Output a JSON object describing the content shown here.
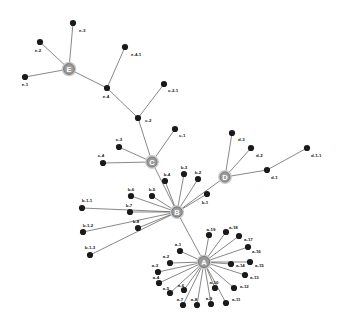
{
  "diagram": {
    "type": "network-graph",
    "title": "",
    "background_color": "#ffffff",
    "leaf_node_color": "#1a1a1a",
    "hub_node_color": "#9a9a9a",
    "hub_halo_color": "#c9c9c9",
    "edge_color": "#555555",
    "label_color": "#111111",
    "hubs": [
      {
        "id": "A",
        "label": "A",
        "x": 204,
        "y": 262,
        "r": 5.6
      },
      {
        "id": "B",
        "label": "B",
        "x": 177,
        "y": 212,
        "r": 5.2
      },
      {
        "id": "C",
        "label": "C",
        "x": 152,
        "y": 162,
        "r": 5.0
      },
      {
        "id": "D",
        "label": "D",
        "x": 225,
        "y": 177,
        "r": 5.0
      },
      {
        "id": "E",
        "label": "E",
        "x": 69,
        "y": 69,
        "r": 5.4
      }
    ],
    "nodes": [
      {
        "id": "e-1",
        "label": "e-1",
        "x": 25,
        "y": 77,
        "lx": 25,
        "ly": 84,
        "anchor": "middle"
      },
      {
        "id": "e-2",
        "label": "e-2",
        "x": 40,
        "y": 42,
        "lx": 38,
        "ly": 50,
        "anchor": "middle"
      },
      {
        "id": "e-3",
        "label": "e-3",
        "x": 73,
        "y": 23,
        "lx": 79,
        "ly": 30,
        "anchor": "start"
      },
      {
        "id": "e-4",
        "label": "e-4",
        "x": 107,
        "y": 88,
        "lx": 106,
        "ly": 96,
        "anchor": "middle"
      },
      {
        "id": "e-4-1",
        "label": "e-4-1",
        "x": 125,
        "y": 47,
        "lx": 131,
        "ly": 54,
        "anchor": "start"
      },
      {
        "id": "c-2",
        "label": "c-2",
        "x": 138,
        "y": 118,
        "lx": 145,
        "ly": 120,
        "anchor": "start"
      },
      {
        "id": "c-2-1",
        "label": "c-2-1",
        "x": 164,
        "y": 84,
        "lx": 168,
        "ly": 90,
        "anchor": "start"
      },
      {
        "id": "c-1",
        "label": "c-1",
        "x": 175,
        "y": 129,
        "lx": 179,
        "ly": 135,
        "anchor": "start"
      },
      {
        "id": "c-3",
        "label": "c-3",
        "x": 119,
        "y": 147,
        "lx": 119,
        "ly": 139,
        "anchor": "middle"
      },
      {
        "id": "c-4",
        "label": "c-4",
        "x": 103,
        "y": 163,
        "lx": 101,
        "ly": 155,
        "anchor": "middle"
      },
      {
        "id": "b-1",
        "label": "b-1",
        "x": 207,
        "y": 194,
        "lx": 205,
        "ly": 202,
        "anchor": "middle"
      },
      {
        "id": "b-2",
        "label": "b-2",
        "x": 198,
        "y": 179,
        "lx": 198,
        "ly": 172,
        "anchor": "middle"
      },
      {
        "id": "b-3",
        "label": "b-3",
        "x": 184,
        "y": 174,
        "lx": 184,
        "ly": 167,
        "anchor": "middle"
      },
      {
        "id": "b-4",
        "label": "b-4",
        "x": 165,
        "y": 181,
        "lx": 167,
        "ly": 174,
        "anchor": "middle"
      },
      {
        "id": "b-5",
        "label": "b-5",
        "x": 152,
        "y": 196,
        "lx": 152,
        "ly": 189,
        "anchor": "middle"
      },
      {
        "id": "b-6",
        "label": "b-6",
        "x": 131,
        "y": 196,
        "lx": 131,
        "ly": 189,
        "anchor": "middle"
      },
      {
        "id": "b-7",
        "label": "b-7",
        "x": 130,
        "y": 212,
        "lx": 129,
        "ly": 205,
        "anchor": "middle"
      },
      {
        "id": "b-8",
        "label": "b-8",
        "x": 138,
        "y": 228,
        "lx": 136,
        "ly": 221,
        "anchor": "middle"
      },
      {
        "id": "b-1-1",
        "label": "b-1-1",
        "x": 82,
        "y": 208,
        "lx": 87,
        "ly": 200,
        "anchor": "middle"
      },
      {
        "id": "b-1-2",
        "label": "b-1-2",
        "x": 83,
        "y": 232,
        "lx": 88,
        "ly": 225,
        "anchor": "middle"
      },
      {
        "id": "b-1-3",
        "label": "b-1-3",
        "x": 90,
        "y": 255,
        "lx": 90,
        "ly": 247,
        "anchor": "middle"
      },
      {
        "id": "d-1",
        "label": "d-1",
        "x": 267,
        "y": 170,
        "lx": 271,
        "ly": 177,
        "anchor": "start"
      },
      {
        "id": "d-1-1",
        "label": "d-1-1",
        "x": 307,
        "y": 148,
        "lx": 311,
        "ly": 155,
        "anchor": "start"
      },
      {
        "id": "d-2",
        "label": "d-2",
        "x": 251,
        "y": 148,
        "lx": 256,
        "ly": 155,
        "anchor": "start"
      },
      {
        "id": "d-3",
        "label": "d-3",
        "x": 232,
        "y": 133,
        "lx": 238,
        "ly": 139,
        "anchor": "start"
      },
      {
        "id": "a-1",
        "label": "a-1",
        "x": 180,
        "y": 251,
        "lx": 178,
        "ly": 244,
        "anchor": "middle"
      },
      {
        "id": "a-2",
        "label": "a-2",
        "x": 170,
        "y": 263,
        "lx": 166,
        "ly": 256,
        "anchor": "middle"
      },
      {
        "id": "a-3",
        "label": "a-3",
        "x": 158,
        "y": 272,
        "lx": 155,
        "ly": 265,
        "anchor": "middle"
      },
      {
        "id": "a-4",
        "label": "a-4",
        "x": 159,
        "y": 283,
        "lx": 156,
        "ly": 277,
        "anchor": "middle"
      },
      {
        "id": "a-5",
        "label": "a-5",
        "x": 170,
        "y": 293,
        "lx": 166,
        "ly": 288,
        "anchor": "middle"
      },
      {
        "id": "a-6",
        "label": "a-6",
        "x": 184,
        "y": 290,
        "lx": 181,
        "ly": 285,
        "anchor": "middle"
      },
      {
        "id": "a-7",
        "label": "a-7",
        "x": 183,
        "y": 305,
        "lx": 180,
        "ly": 299,
        "anchor": "middle"
      },
      {
        "id": "a-8",
        "label": "a-8",
        "x": 197,
        "y": 305,
        "lx": 194,
        "ly": 299,
        "anchor": "middle"
      },
      {
        "id": "a-9",
        "label": "a-9",
        "x": 211,
        "y": 304,
        "lx": 209,
        "ly": 298,
        "anchor": "middle"
      },
      {
        "id": "a-10",
        "label": "a-10",
        "x": 215,
        "y": 288,
        "lx": 214,
        "ly": 282,
        "anchor": "middle"
      },
      {
        "id": "a-11",
        "label": "a-11",
        "x": 226,
        "y": 303,
        "lx": 232,
        "ly": 299,
        "anchor": "start"
      },
      {
        "id": "a-12",
        "label": "a-12",
        "x": 234,
        "y": 288,
        "lx": 240,
        "ly": 286,
        "anchor": "start"
      },
      {
        "id": "a-13",
        "label": "a-13",
        "x": 245,
        "y": 275,
        "lx": 250,
        "ly": 277,
        "anchor": "start"
      },
      {
        "id": "a-14",
        "label": "a-14",
        "x": 231,
        "y": 264,
        "lx": 236,
        "ly": 265,
        "anchor": "start"
      },
      {
        "id": "a-15",
        "label": "a-15",
        "x": 250,
        "y": 262,
        "lx": 255,
        "ly": 265,
        "anchor": "start"
      },
      {
        "id": "a-16",
        "label": "a-16",
        "x": 248,
        "y": 247,
        "lx": 252,
        "ly": 251,
        "anchor": "start"
      },
      {
        "id": "a-17",
        "label": "a-17",
        "x": 239,
        "y": 236,
        "lx": 244,
        "ly": 239,
        "anchor": "start"
      },
      {
        "id": "a-18",
        "label": "a-18",
        "x": 226,
        "y": 232,
        "lx": 229,
        "ly": 227,
        "anchor": "start"
      },
      {
        "id": "a-19",
        "label": "a-19",
        "x": 209,
        "y": 235,
        "lx": 211,
        "ly": 229,
        "anchor": "middle"
      }
    ],
    "edges": [
      {
        "from": "E",
        "to": "e-1"
      },
      {
        "from": "E",
        "to": "e-2"
      },
      {
        "from": "E",
        "to": "e-3"
      },
      {
        "from": "E",
        "to": "e-4"
      },
      {
        "from": "e-4",
        "to": "e-4-1"
      },
      {
        "from": "e-4",
        "to": "c-2"
      },
      {
        "from": "c-2",
        "to": "c-2-1"
      },
      {
        "from": "c-2",
        "to": "C"
      },
      {
        "from": "C",
        "to": "c-1"
      },
      {
        "from": "C",
        "to": "c-3"
      },
      {
        "from": "C",
        "to": "c-4"
      },
      {
        "from": "C",
        "to": "B"
      },
      {
        "from": "B",
        "to": "b-1"
      },
      {
        "from": "B",
        "to": "b-2"
      },
      {
        "from": "B",
        "to": "b-3"
      },
      {
        "from": "B",
        "to": "b-4"
      },
      {
        "from": "B",
        "to": "b-5"
      },
      {
        "from": "B",
        "to": "b-6"
      },
      {
        "from": "B",
        "to": "b-7"
      },
      {
        "from": "B",
        "to": "b-8"
      },
      {
        "from": "B",
        "to": "b-1-1"
      },
      {
        "from": "B",
        "to": "b-1-2"
      },
      {
        "from": "B",
        "to": "b-1-3"
      },
      {
        "from": "B",
        "to": "D"
      },
      {
        "from": "B",
        "to": "A"
      },
      {
        "from": "D",
        "to": "d-1"
      },
      {
        "from": "D",
        "to": "d-2"
      },
      {
        "from": "D",
        "to": "d-3"
      },
      {
        "from": "d-1",
        "to": "d-1-1"
      },
      {
        "from": "A",
        "to": "a-1"
      },
      {
        "from": "A",
        "to": "a-2"
      },
      {
        "from": "A",
        "to": "a-3"
      },
      {
        "from": "A",
        "to": "a-4"
      },
      {
        "from": "A",
        "to": "a-5"
      },
      {
        "from": "A",
        "to": "a-6"
      },
      {
        "from": "A",
        "to": "a-7"
      },
      {
        "from": "A",
        "to": "a-8"
      },
      {
        "from": "A",
        "to": "a-9"
      },
      {
        "from": "A",
        "to": "a-10"
      },
      {
        "from": "A",
        "to": "a-11"
      },
      {
        "from": "A",
        "to": "a-12"
      },
      {
        "from": "A",
        "to": "a-13"
      },
      {
        "from": "A",
        "to": "a-14"
      },
      {
        "from": "A",
        "to": "a-15"
      },
      {
        "from": "A",
        "to": "a-16"
      },
      {
        "from": "A",
        "to": "a-17"
      },
      {
        "from": "A",
        "to": "a-18"
      },
      {
        "from": "A",
        "to": "a-19"
      }
    ]
  }
}
